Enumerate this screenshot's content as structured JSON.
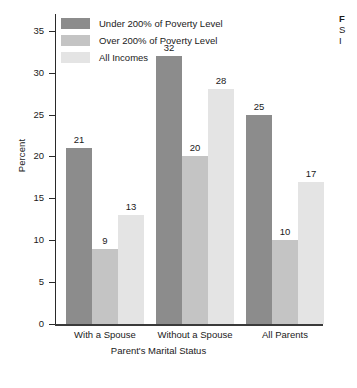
{
  "chart_data": {
    "type": "bar",
    "title": "",
    "xlabel": "Parent's Marital Status",
    "ylabel": "Percent",
    "ylim": [
      0,
      37
    ],
    "yticks": [
      0,
      5,
      10,
      15,
      20,
      25,
      30,
      35
    ],
    "grid": false,
    "legend_position": "top-left inside plot",
    "categories": [
      "With a Spouse",
      "Without a Spouse",
      "All Parents"
    ],
    "series": [
      {
        "name": "Under 200% of Poverty Level",
        "color": "#8c8c8c",
        "values": [
          21,
          32,
          25
        ]
      },
      {
        "name": "Over 200% of Poverty Level",
        "color": "#c4c4c4",
        "values": [
          9,
          20,
          10
        ]
      },
      {
        "name": "All Incomes",
        "color": "#e4e4e4",
        "values": [
          13,
          28,
          17
        ]
      }
    ]
  },
  "legend": {
    "items": [
      {
        "label": "Under 200% of Poverty Level",
        "color": "#8c8c8c"
      },
      {
        "label": "Over 200% of Poverty Level",
        "color": "#c4c4c4"
      },
      {
        "label": "All Incomes",
        "color": "#e4e4e4"
      }
    ]
  },
  "axes": {
    "y_label": "Percent",
    "x_label": "Parent's Marital Status",
    "y_ticks": [
      "0",
      "5",
      "10",
      "15",
      "20",
      "25",
      "30",
      "35"
    ],
    "x_ticks": [
      "With a Spouse",
      "Without a Spouse",
      "All Parents"
    ]
  },
  "side_caption": {
    "line1": "F",
    "line2": "S",
    "line3": "I"
  }
}
